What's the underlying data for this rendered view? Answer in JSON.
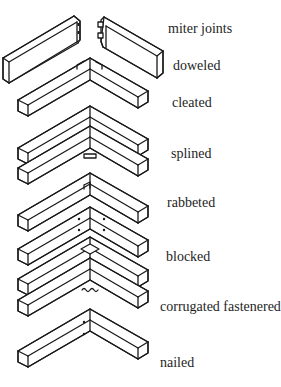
{
  "figure": {
    "labels": [
      {
        "id": "miter-joints",
        "text": "miter joints"
      },
      {
        "id": "doweled",
        "text": "doweled"
      },
      {
        "id": "cleated",
        "text": "cleated"
      },
      {
        "id": "splined",
        "text": "splined"
      },
      {
        "id": "rabbeted",
        "text": "rabbeted"
      },
      {
        "id": "blocked",
        "text": "blocked"
      },
      {
        "id": "corrugated-fastenered",
        "text": "corrugated fastenered"
      },
      {
        "id": "nailed",
        "text": "nailed"
      }
    ]
  }
}
